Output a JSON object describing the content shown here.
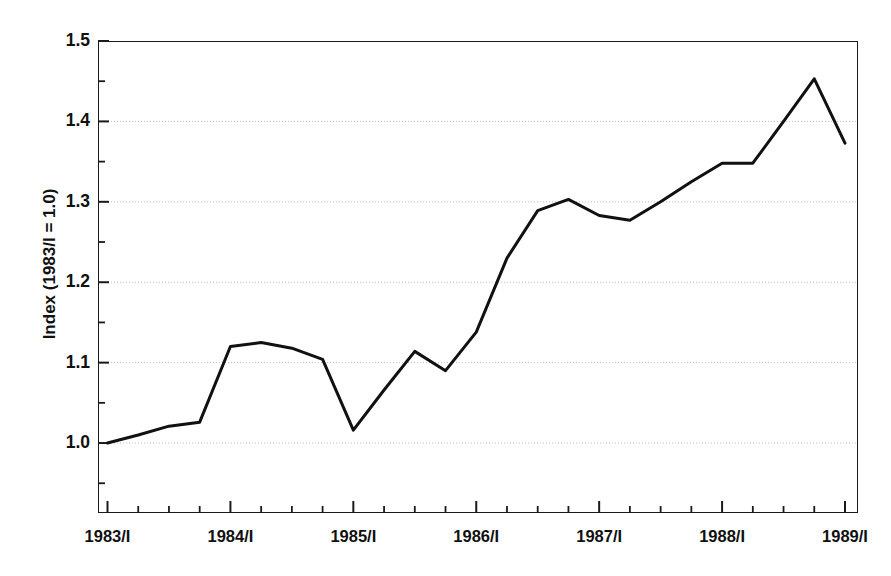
{
  "chart_data": {
    "type": "line",
    "title": "",
    "subtitle": "",
    "xlabel": "",
    "ylabel": "Index (1983/I = 1.0)",
    "ylim": [
      0.913,
      1.5
    ],
    "ytick_values": [
      1.0,
      1.1,
      1.2,
      1.3,
      1.4,
      1.5
    ],
    "ytick_labels": [
      "1.0",
      "1.1",
      "1.2",
      "1.3",
      "1.4",
      "1.5"
    ],
    "yminor_values": [
      1.05,
      1.15,
      1.25,
      1.35,
      1.45,
      0.95
    ],
    "xtick_labels": [
      "1983/I",
      "1984/I",
      "1985/I",
      "1986/I",
      "1987/I",
      "1988/I",
      "1989/I"
    ],
    "xtick_positions": [
      0,
      4,
      8,
      12,
      16,
      20,
      24
    ],
    "x_minor_every": 1,
    "grid": "horizontal-dotted",
    "legend": "none",
    "line_color": "#111111",
    "line_width": 3.0,
    "x": [
      "1983/I",
      "1983/II",
      "1983/III",
      "1983/IV",
      "1984/I",
      "1984/II",
      "1984/III",
      "1984/IV",
      "1985/I",
      "1985/II",
      "1985/III",
      "1985/IV",
      "1986/I",
      "1986/II",
      "1986/III",
      "1986/IV",
      "1987/I",
      "1987/II",
      "1987/III",
      "1987/IV",
      "1988/I",
      "1988/II",
      "1988/III",
      "1988/IV",
      "1989/I"
    ],
    "values": [
      1.0,
      1.01,
      1.021,
      1.026,
      1.12,
      1.125,
      1.118,
      1.104,
      1.016,
      1.066,
      1.114,
      1.09,
      1.138,
      1.23,
      1.289,
      1.303,
      1.283,
      1.277,
      1.3,
      1.325,
      1.348,
      1.348,
      1.4,
      1.453,
      1.373
    ],
    "series": [
      {
        "name": "Index",
        "values": [
          1.0,
          1.01,
          1.021,
          1.026,
          1.12,
          1.125,
          1.118,
          1.104,
          1.016,
          1.066,
          1.114,
          1.09,
          1.138,
          1.23,
          1.289,
          1.303,
          1.283,
          1.277,
          1.3,
          1.325,
          1.348,
          1.348,
          1.4,
          1.453,
          1.373
        ]
      }
    ],
    "annotations": []
  },
  "axis": {
    "y_title": "Index (1983/I = 1.0)"
  }
}
